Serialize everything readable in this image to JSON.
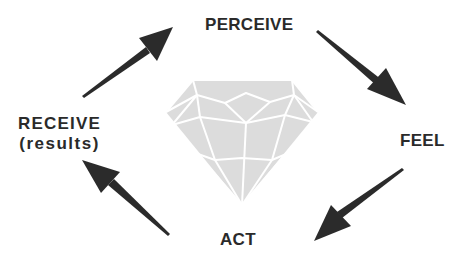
{
  "diagram": {
    "type": "cycle",
    "center_graphic": "diamond",
    "colors": {
      "text": "#2a2a2a",
      "arrow": "#2b2b2b",
      "diamond_fill": "#dcdcdc",
      "diamond_lines": "#ffffff",
      "background": "#ffffff"
    },
    "nodes": [
      {
        "id": "perceive",
        "label": "PERCEIVE"
      },
      {
        "id": "feel",
        "label": "FEEL"
      },
      {
        "id": "act",
        "label": "ACT"
      },
      {
        "id": "receive",
        "label": "RECEIVE",
        "sublabel": "(results)"
      }
    ],
    "edges": [
      {
        "from": "perceive",
        "to": "feel"
      },
      {
        "from": "feel",
        "to": "act"
      },
      {
        "from": "act",
        "to": "receive"
      },
      {
        "from": "receive",
        "to": "perceive"
      }
    ]
  }
}
